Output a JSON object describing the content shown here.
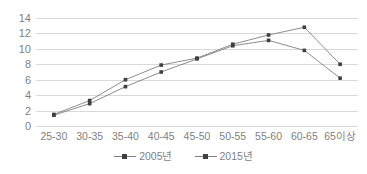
{
  "chart_data": {
    "type": "line",
    "title": "",
    "xlabel": "",
    "ylabel": "",
    "ylim": [
      0,
      14
    ],
    "ytick_step": 2,
    "yticks": [
      14,
      12,
      10,
      8,
      6,
      4,
      2,
      0
    ],
    "grid": true,
    "legend_position": "bottom",
    "categories": [
      "25-30",
      "30-35",
      "35-40",
      "40-45",
      "45-50",
      "50-55",
      "55-60",
      "60-65",
      "65이상"
    ],
    "series": [
      {
        "name": "2005년",
        "color": "#404040",
        "marker": "square",
        "values": [
          1.5,
          3.3,
          6.0,
          7.9,
          8.8,
          10.6,
          11.8,
          12.8,
          8.0
        ]
      },
      {
        "name": "2015년",
        "color": "#404040",
        "marker": "square",
        "values": [
          1.4,
          2.9,
          5.1,
          7.0,
          8.7,
          10.4,
          11.1,
          9.8,
          6.2
        ]
      }
    ],
    "colors": {
      "gridline": "#d9d9d9",
      "axis_text": "#7f7f7f",
      "line": "#808080",
      "marker": "#3f3f3f",
      "background": "#ffffff"
    }
  }
}
